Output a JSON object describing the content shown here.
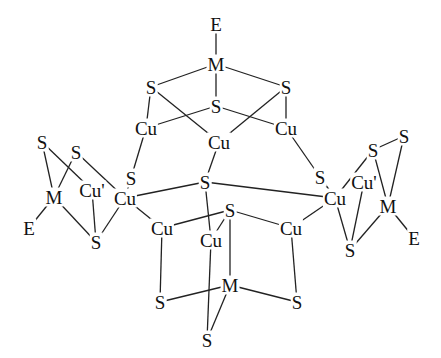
{
  "diagram": {
    "type": "chemical-structure",
    "line_color": "#222222",
    "atoms": [
      {
        "id": "E1",
        "label": "E",
        "x": 216,
        "y": 24
      },
      {
        "id": "M1",
        "label": "M",
        "x": 216,
        "y": 64
      },
      {
        "id": "S1",
        "label": "S",
        "x": 151,
        "y": 87
      },
      {
        "id": "S2",
        "label": "S",
        "x": 286,
        "y": 87
      },
      {
        "id": "S3",
        "label": "S",
        "x": 216,
        "y": 106
      },
      {
        "id": "Cu1",
        "label": "Cu",
        "x": 146,
        "y": 128
      },
      {
        "id": "Cu2",
        "label": "Cu",
        "x": 219,
        "y": 142
      },
      {
        "id": "Cu3",
        "label": "Cu",
        "x": 286,
        "y": 128
      },
      {
        "id": "S4",
        "label": "S",
        "x": 42,
        "y": 142
      },
      {
        "id": "S5",
        "label": "S",
        "x": 76,
        "y": 152
      },
      {
        "id": "Cu4",
        "label": "Cu'",
        "x": 92,
        "y": 190
      },
      {
        "id": "M2",
        "label": "M",
        "x": 54,
        "y": 197
      },
      {
        "id": "E2",
        "label": "E",
        "x": 29,
        "y": 228
      },
      {
        "id": "S6",
        "label": "S",
        "x": 96,
        "y": 242
      },
      {
        "id": "S7",
        "label": "S",
        "x": 131,
        "y": 178
      },
      {
        "id": "Cu5",
        "label": "Cu",
        "x": 125,
        "y": 198
      },
      {
        "id": "S8",
        "label": "S",
        "x": 205,
        "y": 182
      },
      {
        "id": "S9",
        "label": "S",
        "x": 320,
        "y": 177
      },
      {
        "id": "Cu6",
        "label": "Cu",
        "x": 335,
        "y": 198
      },
      {
        "id": "S10",
        "label": "S",
        "x": 373,
        "y": 150
      },
      {
        "id": "S11",
        "label": "S",
        "x": 404,
        "y": 136
      },
      {
        "id": "Cu7",
        "label": "Cu'",
        "x": 364,
        "y": 182
      },
      {
        "id": "M3",
        "label": "M",
        "x": 388,
        "y": 206
      },
      {
        "id": "E3",
        "label": "E",
        "x": 414,
        "y": 238
      },
      {
        "id": "S12",
        "label": "S",
        "x": 350,
        "y": 250
      },
      {
        "id": "Cu8",
        "label": "Cu",
        "x": 162,
        "y": 228
      },
      {
        "id": "Cu9",
        "label": "Cu",
        "x": 211,
        "y": 240
      },
      {
        "id": "S13",
        "label": "S",
        "x": 230,
        "y": 210
      },
      {
        "id": "Cu10",
        "label": "Cu",
        "x": 291,
        "y": 228
      },
      {
        "id": "M4",
        "label": "M",
        "x": 230,
        "y": 285
      },
      {
        "id": "S14",
        "label": "S",
        "x": 160,
        "y": 302
      },
      {
        "id": "S15",
        "label": "S",
        "x": 297,
        "y": 302
      },
      {
        "id": "S16",
        "label": "S",
        "x": 207,
        "y": 340
      }
    ],
    "bonds": [
      [
        "E1",
        "M1"
      ],
      [
        "M1",
        "S1"
      ],
      [
        "M1",
        "S2"
      ],
      [
        "M1",
        "S3"
      ],
      [
        "S1",
        "Cu1"
      ],
      [
        "S1",
        "Cu2"
      ],
      [
        "S2",
        "Cu2"
      ],
      [
        "S2",
        "Cu3"
      ],
      [
        "S3",
        "Cu1"
      ],
      [
        "S3",
        "Cu3"
      ],
      [
        "Cu1",
        "S7"
      ],
      [
        "Cu2",
        "S8"
      ],
      [
        "Cu3",
        "S9"
      ],
      [
        "S7",
        "Cu5"
      ],
      [
        "S9",
        "Cu6"
      ],
      [
        "S8",
        "Cu5"
      ],
      [
        "S8",
        "Cu6"
      ],
      [
        "S8",
        "Cu9"
      ],
      [
        "S4",
        "M2"
      ],
      [
        "S4",
        "Cu4"
      ],
      [
        "S5",
        "M2"
      ],
      [
        "S5",
        "Cu5"
      ],
      [
        "M2",
        "E2"
      ],
      [
        "M2",
        "S6"
      ],
      [
        "Cu4",
        "S6"
      ],
      [
        "Cu5",
        "S6"
      ],
      [
        "S11",
        "M3"
      ],
      [
        "S11",
        "S10"
      ],
      [
        "S10",
        "M3"
      ],
      [
        "S10",
        "Cu6"
      ],
      [
        "M3",
        "E3"
      ],
      [
        "M3",
        "S12"
      ],
      [
        "Cu7",
        "S12"
      ],
      [
        "Cu6",
        "S12"
      ],
      [
        "Cu5",
        "Cu8"
      ],
      [
        "Cu6",
        "Cu10"
      ],
      [
        "Cu8",
        "S13"
      ],
      [
        "S13",
        "Cu10"
      ],
      [
        "S13",
        "Cu9"
      ],
      [
        "S13",
        "M4"
      ],
      [
        "Cu8",
        "S14"
      ],
      [
        "Cu10",
        "S15"
      ],
      [
        "S14",
        "M4"
      ],
      [
        "M4",
        "S15"
      ],
      [
        "M4",
        "S16"
      ],
      [
        "Cu9",
        "S16"
      ]
    ]
  }
}
